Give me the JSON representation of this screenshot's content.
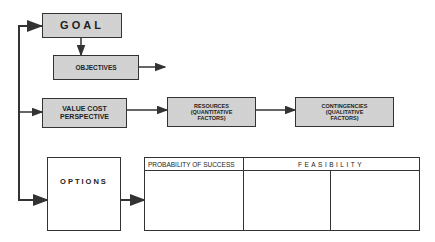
{
  "diagram": {
    "goal": {
      "label": "GOAL"
    },
    "objectives": {
      "label": "OBJECTIVES"
    },
    "value_cost": {
      "label": "VALUE COST PERSPECTIVE"
    },
    "resources": {
      "line1": "RESOURCES",
      "line2": "(QUANTITATIVE",
      "line3": "FACTORS)"
    },
    "contingencies": {
      "line1": "CONTINGENCIES",
      "line2": "(QUALITATIVE",
      "line3": "FACTORS)"
    },
    "options": {
      "label": "OPTIONS"
    },
    "table": {
      "headers": [
        "PROBABILITY OF SUCCESS",
        "FEASIBILITY"
      ],
      "columns": 3,
      "rows": 1
    },
    "colors": {
      "line": "#333333",
      "fill": "#e4e4e4"
    }
  }
}
